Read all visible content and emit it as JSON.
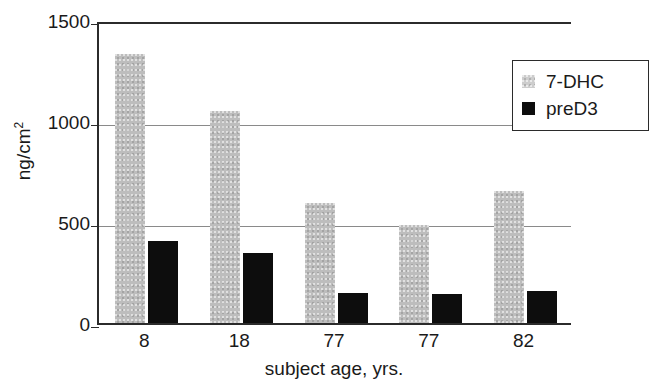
{
  "chart_data": {
    "type": "bar",
    "title": "",
    "subtitle": "",
    "xlabel": "subject age, yrs.",
    "ylabel": "ng/cm2",
    "ylabel_base": "ng/cm",
    "ylabel_sup": "2",
    "categories": [
      "8",
      "18",
      "77",
      "77",
      "82"
    ],
    "series": [
      {
        "name": "7-DHC",
        "color": "#bdbdbd",
        "values": [
          1330,
          1050,
          595,
          487,
          655
        ]
      },
      {
        "name": "preD3",
        "color": "#0d0d0d",
        "values": [
          407,
          347,
          149,
          144,
          159
        ]
      }
    ],
    "ylim": [
      0,
      1500
    ],
    "yticks": [
      0,
      500,
      1000,
      1500
    ],
    "ytick_labels": [
      "0",
      "500",
      "1000",
      "1500"
    ],
    "gridlines": [
      500,
      1000
    ],
    "grid": true,
    "legend_position": "top-right",
    "legend_entries": [
      "7-DHC",
      "preD3"
    ]
  }
}
